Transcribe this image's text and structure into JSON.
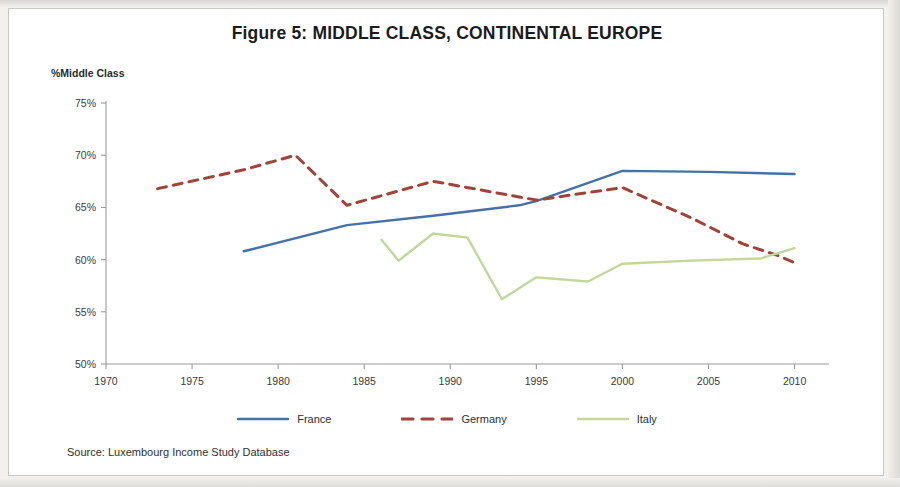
{
  "figure": {
    "title": "Figure 5: MIDDLE CLASS, CONTINENTAL EUROPE",
    "source_note": "Source: Luxembourg Income Study Database",
    "y_axis_title": "%Middle Class"
  },
  "legend": {
    "items": [
      {
        "label": "France",
        "color": "#4472A8",
        "style": "solid"
      },
      {
        "label": "Germany",
        "color": "#A0443A",
        "style": "dashed"
      },
      {
        "label": "Italy",
        "color": "#C3D69B",
        "style": "solid"
      }
    ]
  },
  "chart_data": {
    "type": "line",
    "title": "Figure 5: MIDDLE CLASS, CONTINENTAL EUROPE",
    "subtitle": "",
    "xlabel": "",
    "ylabel": "%Middle Class",
    "xlim": [
      1970,
      2012
    ],
    "ylim": [
      50,
      75
    ],
    "xticks": [
      1970,
      1975,
      1980,
      1985,
      1990,
      1995,
      2000,
      2005,
      2010
    ],
    "xtick_labels": [
      "1970",
      "1975",
      "1980",
      "1985",
      "1990",
      "1995",
      "2000",
      "2005",
      "2010"
    ],
    "yticks": [
      50,
      55,
      60,
      65,
      70,
      75
    ],
    "ytick_labels": [
      "50%",
      "55%",
      "60%",
      "65%",
      "70%",
      "75%"
    ],
    "grid": false,
    "legend_position": "bottom",
    "series": [
      {
        "name": "France",
        "color": "#4472A8",
        "style": "solid",
        "points": [
          [
            1978,
            60.8
          ],
          [
            1984,
            63.3
          ],
          [
            1989,
            64.2
          ],
          [
            1994,
            65.2
          ],
          [
            1995,
            65.6
          ],
          [
            2000,
            68.5
          ],
          [
            2005,
            68.4
          ],
          [
            2010,
            68.2
          ]
        ]
      },
      {
        "name": "Germany",
        "color": "#A0443A",
        "style": "dashed",
        "points": [
          [
            1973,
            66.8
          ],
          [
            1978,
            68.6
          ],
          [
            1981,
            70.0
          ],
          [
            1984,
            65.2
          ],
          [
            1989,
            67.5
          ],
          [
            1994,
            66.0
          ],
          [
            1995,
            65.7
          ],
          [
            2000,
            66.9
          ],
          [
            2004,
            64.0
          ],
          [
            2007,
            61.5
          ],
          [
            2009,
            60.4
          ],
          [
            2010,
            59.7
          ]
        ]
      },
      {
        "name": "Italy",
        "color": "#C3D69B",
        "style": "solid",
        "points": [
          [
            1986,
            61.9
          ],
          [
            1987,
            59.9
          ],
          [
            1989,
            62.5
          ],
          [
            1991,
            62.1
          ],
          [
            1993,
            56.2
          ],
          [
            1995,
            58.3
          ],
          [
            1998,
            57.9
          ],
          [
            2000,
            59.6
          ],
          [
            2004,
            59.9
          ],
          [
            2008,
            60.1
          ],
          [
            2010,
            61.1
          ]
        ]
      }
    ]
  }
}
